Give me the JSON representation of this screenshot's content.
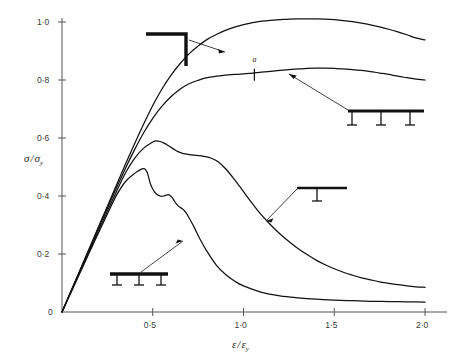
{
  "chart_data": {
    "type": "line",
    "title": "",
    "xlabel": "ε/εy",
    "ylabel": "σ/σy",
    "xlim": [
      0,
      2.15
    ],
    "ylim": [
      0,
      1.08
    ],
    "grid": false,
    "legend_position": "inline-annotations",
    "xticks": [
      {
        "value": 0.5,
        "label": "0·5"
      },
      {
        "value": 1.0,
        "label": "1·0"
      },
      {
        "value": 1.5,
        "label": "1·5"
      },
      {
        "value": 2.0,
        "label": "2·0"
      }
    ],
    "yticks": [
      {
        "value": 0.0,
        "label": "0"
      },
      {
        "value": 0.2,
        "label": "0·2"
      },
      {
        "value": 0.4,
        "label": "0·4"
      },
      {
        "value": 0.6,
        "label": "0·6"
      },
      {
        "value": 0.8,
        "label": "0·8"
      },
      {
        "value": 1.0,
        "label": "1·0"
      }
    ],
    "annotations": [
      {
        "name": "point-a",
        "label": "a",
        "x": 1.06,
        "y": 0.815
      }
    ],
    "series": [
      {
        "name": "angle-corner-section",
        "symbol": "angle-bracket",
        "x": [
          0.0,
          0.05,
          0.1,
          0.15,
          0.2,
          0.25,
          0.3,
          0.35,
          0.4,
          0.45,
          0.5,
          0.55,
          0.6,
          0.65,
          0.7,
          0.75,
          0.8,
          0.85,
          0.9,
          0.95,
          1.0,
          1.05,
          1.1,
          1.15,
          1.2,
          1.25,
          1.3,
          1.35,
          1.4,
          1.45,
          1.5,
          1.55,
          1.6,
          1.65,
          1.7,
          1.75,
          1.8,
          1.85,
          1.9,
          1.95,
          2.0
        ],
        "y": [
          0.0,
          0.073,
          0.146,
          0.219,
          0.292,
          0.365,
          0.438,
          0.51,
          0.58,
          0.648,
          0.712,
          0.768,
          0.816,
          0.856,
          0.89,
          0.917,
          0.94,
          0.957,
          0.971,
          0.982,
          0.991,
          0.998,
          1.003,
          1.006,
          1.008,
          1.01,
          1.011,
          1.011,
          1.011,
          1.01,
          1.008,
          1.005,
          1.001,
          0.996,
          0.99,
          0.983,
          0.975,
          0.966,
          0.956,
          0.945,
          0.938
        ]
      },
      {
        "name": "three-support-beam-wide",
        "symbol": "beam-three-supports",
        "x": [
          0.0,
          0.05,
          0.1,
          0.15,
          0.2,
          0.25,
          0.3,
          0.35,
          0.4,
          0.45,
          0.5,
          0.55,
          0.6,
          0.65,
          0.7,
          0.75,
          0.8,
          0.85,
          0.9,
          0.95,
          1.0,
          1.05,
          1.1,
          1.15,
          1.2,
          1.25,
          1.3,
          1.35,
          1.4,
          1.45,
          1.5,
          1.55,
          1.6,
          1.65,
          1.7,
          1.75,
          1.8,
          1.85,
          1.9,
          1.95,
          2.0
        ],
        "y": [
          0.0,
          0.072,
          0.144,
          0.216,
          0.288,
          0.358,
          0.428,
          0.496,
          0.56,
          0.618,
          0.668,
          0.709,
          0.742,
          0.768,
          0.787,
          0.799,
          0.808,
          0.813,
          0.817,
          0.819,
          0.821,
          0.824,
          0.827,
          0.83,
          0.833,
          0.836,
          0.838,
          0.84,
          0.841,
          0.841,
          0.84,
          0.838,
          0.836,
          0.833,
          0.829,
          0.824,
          0.819,
          0.813,
          0.808,
          0.803,
          0.8
        ]
      },
      {
        "name": "single-support-beam",
        "symbol": "beam-one-support",
        "x": [
          0.0,
          0.05,
          0.1,
          0.15,
          0.2,
          0.25,
          0.3,
          0.35,
          0.4,
          0.45,
          0.5,
          0.52,
          0.54,
          0.56,
          0.58,
          0.6,
          0.62,
          0.64,
          0.66,
          0.68,
          0.7,
          0.74,
          0.78,
          0.82,
          0.86,
          0.9,
          0.94,
          0.98,
          1.02,
          1.06,
          1.1,
          1.15,
          1.2,
          1.25,
          1.3,
          1.35,
          1.4,
          1.45,
          1.5,
          1.55,
          1.6,
          1.65,
          1.7,
          1.75,
          1.8,
          1.85,
          1.9,
          1.95,
          2.0
        ],
        "y": [
          0.0,
          0.07,
          0.14,
          0.21,
          0.28,
          0.348,
          0.415,
          0.48,
          0.53,
          0.565,
          0.586,
          0.59,
          0.588,
          0.583,
          0.576,
          0.568,
          0.56,
          0.553,
          0.548,
          0.545,
          0.543,
          0.54,
          0.537,
          0.531,
          0.518,
          0.495,
          0.465,
          0.432,
          0.398,
          0.365,
          0.334,
          0.3,
          0.27,
          0.243,
          0.219,
          0.198,
          0.179,
          0.163,
          0.149,
          0.137,
          0.127,
          0.118,
          0.111,
          0.104,
          0.099,
          0.094,
          0.09,
          0.087,
          0.085
        ]
      },
      {
        "name": "three-support-beam-narrow",
        "symbol": "beam-three-supports-short",
        "x": [
          0.0,
          0.05,
          0.1,
          0.15,
          0.2,
          0.25,
          0.3,
          0.35,
          0.4,
          0.43,
          0.45,
          0.46,
          0.47,
          0.475,
          0.48,
          0.485,
          0.49,
          0.5,
          0.51,
          0.52,
          0.53,
          0.54,
          0.55,
          0.56,
          0.57,
          0.58,
          0.59,
          0.6,
          0.605,
          0.61,
          0.62,
          0.63,
          0.64,
          0.65,
          0.66,
          0.67,
          0.68,
          0.7,
          0.73,
          0.76,
          0.8,
          0.85,
          0.9,
          0.95,
          1.0,
          1.1,
          1.2,
          1.3,
          1.4,
          1.5,
          1.6,
          1.7,
          1.8,
          1.9,
          2.0
        ],
        "y": [
          0.0,
          0.068,
          0.136,
          0.204,
          0.272,
          0.338,
          0.402,
          0.45,
          0.478,
          0.49,
          0.494,
          0.491,
          0.48,
          0.47,
          0.458,
          0.446,
          0.437,
          0.424,
          0.414,
          0.407,
          0.403,
          0.4,
          0.399,
          0.4,
          0.402,
          0.404,
          0.404,
          0.399,
          0.396,
          0.392,
          0.382,
          0.373,
          0.366,
          0.361,
          0.357,
          0.352,
          0.345,
          0.325,
          0.29,
          0.252,
          0.208,
          0.162,
          0.13,
          0.107,
          0.09,
          0.068,
          0.056,
          0.049,
          0.044,
          0.041,
          0.039,
          0.037,
          0.036,
          0.035,
          0.034
        ]
      }
    ]
  },
  "symbols": {
    "angle_bracket": "angle-corner-symbol",
    "beam_three_supports": "beam-three-supports-symbol",
    "beam_one_support": "beam-one-support-symbol",
    "beam_three_supports_short": "beam-three-supports-short-symbol"
  },
  "axes": {
    "y_label_numerator": "σ",
    "y_label_slash": "/",
    "y_label_denominator": "σ",
    "y_label_subscript": "y",
    "x_label_numerator": "ε",
    "x_label_slash": "/",
    "x_label_denominator": "ε",
    "x_label_subscript": "y"
  },
  "colors": {
    "curve": "#111111",
    "axis": "#555555",
    "text": "#333333",
    "background": "#ffffff"
  }
}
